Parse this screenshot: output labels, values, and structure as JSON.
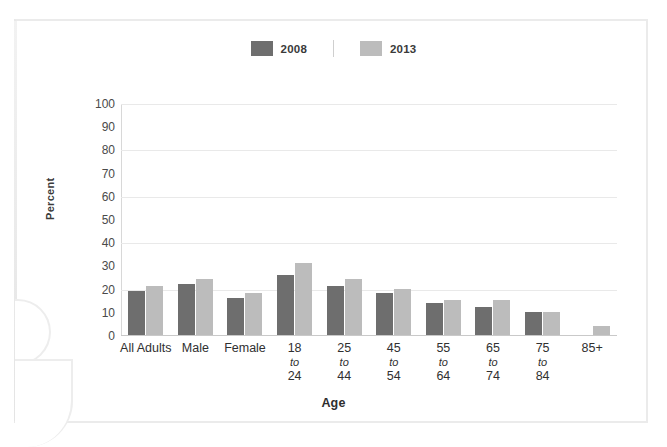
{
  "legend": {
    "items": [
      {
        "label": "2008",
        "color": "#6e6e6e"
      },
      {
        "label": "2013",
        "color": "#bcbcbc"
      }
    ]
  },
  "axes": {
    "y_title": "Percent",
    "x_title": "Age"
  },
  "chart_data": {
    "type": "bar",
    "title": "",
    "xlabel": "Age",
    "ylabel": "Percent",
    "ylim": [
      0,
      100
    ],
    "yticks": [
      0,
      10,
      20,
      30,
      40,
      50,
      60,
      70,
      80,
      90,
      100
    ],
    "grid": true,
    "legend_position": "top-center",
    "categories": [
      "All Adults",
      "Male",
      "Female",
      "18 to 24",
      "25 to 44",
      "45 to 54",
      "55 to 64",
      "65 to 74",
      "75 to 84",
      "85+"
    ],
    "category_lines": [
      [
        "All Adults"
      ],
      [
        "Male"
      ],
      [
        "Female"
      ],
      [
        "18",
        "to",
        "24"
      ],
      [
        "25",
        "to",
        "44"
      ],
      [
        "45",
        "to",
        "54"
      ],
      [
        "55",
        "to",
        "64"
      ],
      [
        "65",
        "to",
        "74"
      ],
      [
        "75",
        "to",
        "84"
      ],
      [
        "85+"
      ]
    ],
    "series": [
      {
        "name": "2008",
        "color": "#6e6e6e",
        "values": [
          19,
          22,
          16,
          26,
          21,
          18,
          14,
          12,
          10,
          0
        ]
      },
      {
        "name": "2013",
        "color": "#bcbcbc",
        "values": [
          21,
          24,
          18,
          31,
          24,
          20,
          15,
          15,
          10,
          4
        ]
      }
    ]
  }
}
